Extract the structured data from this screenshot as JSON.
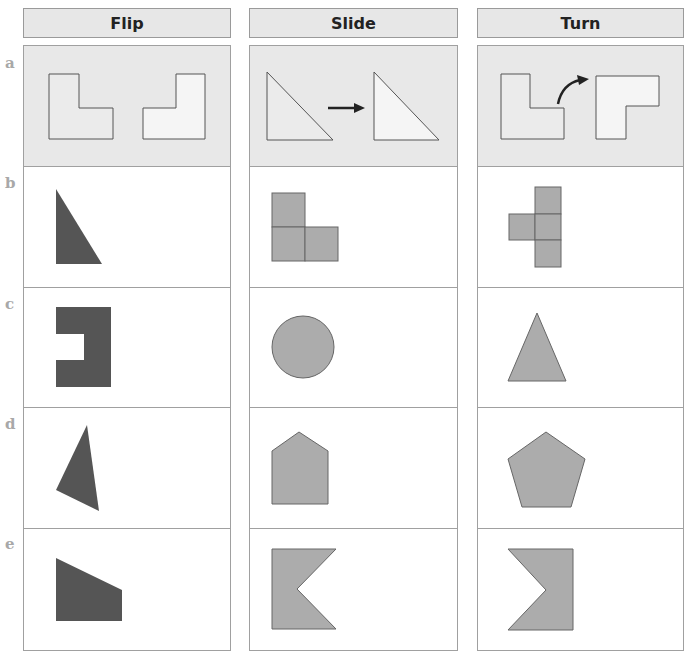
{
  "columns": [
    {
      "label": "Flip"
    },
    {
      "label": "Slide"
    },
    {
      "label": "Turn"
    }
  ],
  "rows": [
    {
      "label": "a",
      "type": "example"
    },
    {
      "label": "b"
    },
    {
      "label": "c"
    },
    {
      "label": "d"
    },
    {
      "label": "e"
    }
  ],
  "colors": {
    "header_bg": "#e7e7e7",
    "example_bg": "#e8e8e8",
    "flip_fill": "#555555",
    "slide_turn_fill": "#acacac",
    "border": "#a0a0a0",
    "row_label": "#a8a8a8"
  },
  "shapes": {
    "a_flip": "L-shape and its mirror image",
    "a_slide": "right triangle slid right with arrow",
    "a_turn": "L-shape rotated with curved arrow",
    "b_flip": "right triangle",
    "b_slide": "L-tromino of squares",
    "b_turn": "T-tetromino of squares",
    "c_flip": "C-shape",
    "c_slide": "circle",
    "c_turn": "isosceles triangle",
    "d_flip": "scalene triangle",
    "d_slide": "house pentagon",
    "d_turn": "regular pentagon",
    "e_flip": "trapezoid",
    "e_slide": "notched flag shape",
    "e_turn": "notched shape"
  }
}
